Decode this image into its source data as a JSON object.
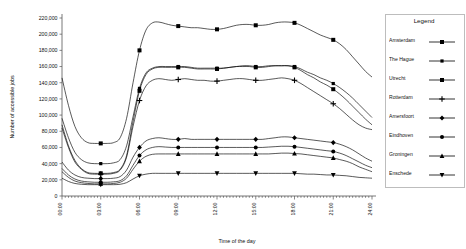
{
  "chart_data": {
    "type": "line",
    "title": "",
    "xlabel": "Time of the day",
    "ylabel": "Number of accessible jobs",
    "ylim": [
      0,
      220000
    ],
    "ytick_labels": [
      "0",
      "20,000",
      "40,000",
      "60,000",
      "80,000",
      "100,000",
      "120,000",
      "140,000",
      "160,000",
      "180,000",
      "200,000",
      "220,000"
    ],
    "ytick_values": [
      0,
      20000,
      40000,
      60000,
      80000,
      100000,
      120000,
      140000,
      160000,
      180000,
      200000,
      220000
    ],
    "xtick_labels": [
      "00:00",
      "03:00",
      "06:00",
      "09:00",
      "12:00",
      "15:00",
      "18:00",
      "21:00",
      "24:00"
    ],
    "xtick_values": [
      0,
      3,
      6,
      9,
      12,
      15,
      18,
      21,
      24
    ],
    "xlim": [
      0,
      24
    ],
    "grid": false,
    "legend_position": "right",
    "x": [
      0,
      0.5,
      1,
      1.5,
      2,
      2.5,
      3,
      3.5,
      4,
      4.5,
      5,
      5.5,
      6,
      6.5,
      7,
      7.5,
      8,
      8.5,
      9,
      9.5,
      10,
      10.5,
      11,
      11.5,
      12,
      12.5,
      13,
      13.5,
      14,
      14.5,
      15,
      15.5,
      16,
      16.5,
      17,
      17.5,
      18,
      18.5,
      19,
      19.5,
      20,
      20.5,
      21,
      21.5,
      22,
      22.5,
      23,
      23.5,
      24
    ],
    "series": [
      {
        "name": "Amsterdam",
        "marker": "square",
        "values": [
          146000,
          112000,
          86000,
          72000,
          66000,
          65000,
          65000,
          65000,
          66000,
          72000,
          96000,
          140000,
          180000,
          205000,
          214000,
          215000,
          213000,
          211000,
          210000,
          209000,
          208000,
          208000,
          207000,
          206000,
          206000,
          207000,
          209000,
          211000,
          212000,
          212000,
          211000,
          211000,
          212000,
          214000,
          215000,
          215000,
          214000,
          211000,
          207000,
          203000,
          199000,
          196000,
          193000,
          188000,
          181000,
          172000,
          163000,
          154000,
          147000
        ]
      },
      {
        "name": "The Hague",
        "marker": "square-small",
        "values": [
          96000,
          72000,
          54000,
          45000,
          41000,
          40000,
          40000,
          40000,
          41000,
          45000,
          62000,
          98000,
          133000,
          152000,
          158000,
          160000,
          160000,
          160000,
          160000,
          160000,
          159000,
          158000,
          158000,
          158000,
          158000,
          158000,
          159000,
          160000,
          161000,
          161000,
          160000,
          160000,
          161000,
          161000,
          161000,
          161000,
          160000,
          157000,
          153000,
          150000,
          146000,
          143000,
          139000,
          134000,
          128000,
          121000,
          113000,
          105000,
          97000
        ]
      },
      {
        "name": "Utrecht",
        "marker": "square",
        "values": [
          88000,
          62000,
          44000,
          34000,
          29000,
          28000,
          28000,
          28000,
          29000,
          33000,
          50000,
          92000,
          130000,
          150000,
          157000,
          159000,
          159000,
          159000,
          159000,
          159000,
          158000,
          157000,
          157000,
          157000,
          157000,
          158000,
          159000,
          160000,
          160000,
          160000,
          159000,
          159000,
          160000,
          161000,
          161000,
          161000,
          159000,
          155000,
          150000,
          146000,
          141000,
          137000,
          132000,
          126000,
          119000,
          111000,
          103000,
          95000,
          88000
        ]
      },
      {
        "name": "Rotterdam",
        "marker": "plus",
        "values": [
          84000,
          60000,
          42000,
          33000,
          28000,
          27000,
          27000,
          27000,
          28000,
          32000,
          48000,
          86000,
          118000,
          136000,
          143000,
          145000,
          144000,
          143000,
          144000,
          145000,
          144000,
          143000,
          143000,
          142000,
          142000,
          143000,
          144000,
          145000,
          145000,
          144000,
          143000,
          143000,
          144000,
          145000,
          146000,
          145000,
          143000,
          139000,
          134000,
          129000,
          124000,
          119000,
          114000,
          108000,
          101000,
          94000,
          88000,
          84000,
          82000
        ]
      },
      {
        "name": "Amersfoort",
        "marker": "diamond",
        "values": [
          42000,
          32000,
          26000,
          23000,
          22000,
          21500,
          21500,
          21500,
          22000,
          24000,
          32000,
          48000,
          60000,
          68000,
          71000,
          72000,
          71000,
          70000,
          70000,
          71000,
          70000,
          70000,
          70000,
          70000,
          70000,
          70000,
          70000,
          70000,
          70000,
          70000,
          70000,
          70000,
          71000,
          72000,
          73000,
          73000,
          72000,
          71000,
          70000,
          69000,
          68000,
          67000,
          66000,
          64000,
          61000,
          57000,
          52000,
          47000,
          43000
        ]
      },
      {
        "name": "Eindhoven",
        "marker": "circle",
        "values": [
          34000,
          26000,
          21000,
          18500,
          17500,
          17000,
          17000,
          17000,
          17500,
          19000,
          25000,
          38000,
          50000,
          57000,
          60000,
          61000,
          60500,
          60000,
          60000,
          60000,
          60000,
          60000,
          60000,
          60000,
          60000,
          60000,
          60000,
          60000,
          60000,
          60000,
          60000,
          60000,
          60500,
          61000,
          61500,
          61500,
          61000,
          60000,
          59000,
          58000,
          57000,
          56000,
          55000,
          53000,
          50000,
          46000,
          42000,
          38000,
          35000
        ]
      },
      {
        "name": "Groningen",
        "marker": "triangle-up",
        "values": [
          30000,
          23000,
          18500,
          16500,
          15500,
          15000,
          15000,
          15000,
          15500,
          17000,
          22000,
          33000,
          43000,
          49000,
          51500,
          52000,
          52000,
          52000,
          52000,
          52000,
          52000,
          52000,
          52000,
          52000,
          52000,
          52000,
          52000,
          52000,
          52000,
          52000,
          52000,
          52000,
          52000,
          52500,
          53000,
          53000,
          52500,
          52000,
          51000,
          50000,
          49000,
          48000,
          47000,
          45000,
          43000,
          40000,
          36000,
          33000,
          30000
        ]
      },
      {
        "name": "Enschede",
        "marker": "triangle-down",
        "values": [
          22000,
          18000,
          15500,
          14500,
          14000,
          14000,
          14000,
          14000,
          14000,
          14500,
          16500,
          21000,
          25000,
          27000,
          28000,
          28000,
          28000,
          28000,
          28000,
          28000,
          28000,
          28000,
          28000,
          28000,
          28000,
          28000,
          28000,
          28000,
          28000,
          28000,
          28000,
          28000,
          28000,
          28000,
          28000,
          28000,
          28000,
          27500,
          27000,
          27000,
          26500,
          26000,
          26000,
          25500,
          25000,
          24000,
          23000,
          22500,
          22000
        ]
      }
    ]
  },
  "legend": {
    "title": "Legend",
    "entries": [
      {
        "label": "Amsterdam",
        "marker": "square"
      },
      {
        "label": "The Hague",
        "marker": "square-small"
      },
      {
        "label": "Utrecht",
        "marker": "square"
      },
      {
        "label": "Rotterdam",
        "marker": "plus"
      },
      {
        "label": "Amersfoort",
        "marker": "diamond"
      },
      {
        "label": "Eindhoven",
        "marker": "circle"
      },
      {
        "label": "Groningen",
        "marker": "triangle-up"
      },
      {
        "label": "Enschede",
        "marker": "triangle-down"
      }
    ]
  },
  "style": {
    "line_color": "#000000",
    "axis_color": "#555555",
    "background": "#ffffff"
  }
}
